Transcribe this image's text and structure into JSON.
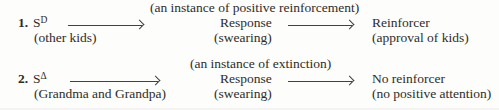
{
  "figure": {
    "colors": {
      "text": "#2e2c29",
      "background": "#fdfdfb",
      "arrow": "#43413e"
    },
    "rows": [
      {
        "number": "1.",
        "stimulus": "S",
        "stimulus_superscript": "D",
        "stimulus_note": "(other kids)",
        "annotation": "(an instance of positive reinforcement)",
        "response_label": "Response",
        "response_note": "(swearing)",
        "consequence_label": "Reinforcer",
        "consequence_note": "(approval of kids)"
      },
      {
        "number": "2.",
        "stimulus": "S",
        "stimulus_superscript": "Δ",
        "stimulus_note": "(Grandma and Grandpa)",
        "annotation": "(an instance of extinction)",
        "response_label": "Response",
        "response_note": "(swearing)",
        "consequence_label": "No reinforcer",
        "consequence_note": "(no positive attention)"
      }
    ]
  }
}
